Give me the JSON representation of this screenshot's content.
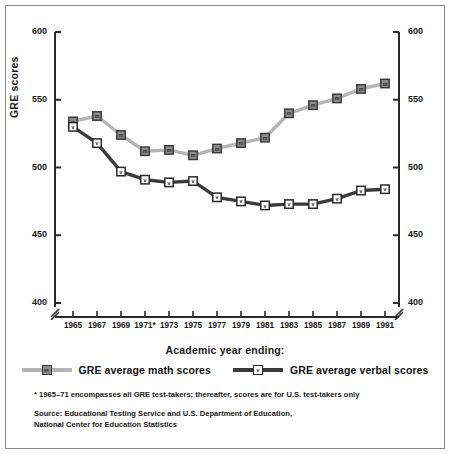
{
  "chart_data": {
    "type": "line",
    "title": "",
    "xlabel": "Academic year ending:",
    "ylabel": "GRE scores",
    "ylim": [
      400,
      600
    ],
    "yticks": [
      400,
      450,
      500,
      550,
      600
    ],
    "grid": false,
    "legend_position": "bottom",
    "axis_break_y": true,
    "x": [
      1965,
      1966,
      1967,
      1968,
      1969,
      1970,
      1971,
      1972,
      1973,
      1974,
      1975,
      1976,
      1977,
      1978,
      1979,
      1980,
      1981,
      1982,
      1983,
      1984,
      1985,
      1986,
      1987,
      1988,
      1989,
      1990,
      1991
    ],
    "xtick_labels": [
      "1965",
      "1967",
      "1969",
      "1971*",
      "1973",
      "1975",
      "1977",
      "1979",
      "1981",
      "1983",
      "1985",
      "1987",
      "1989",
      "1991"
    ],
    "xtick_values": [
      1965,
      1967,
      1969,
      1971,
      1973,
      1975,
      1977,
      1979,
      1981,
      1983,
      1985,
      1987,
      1989,
      1991
    ],
    "series": [
      {
        "name": "GRE average math scores",
        "marker_letter": "m",
        "color": "#b4b4b4",
        "marker_fill": "#8e8e8e",
        "marker_stroke": "#3b3b3b",
        "x": [
          1965,
          1967,
          1969,
          1971,
          1973,
          1975,
          1977,
          1979,
          1981,
          1983,
          1985,
          1987,
          1989,
          1991
        ],
        "values": [
          534,
          538,
          524,
          512,
          513,
          509,
          514,
          518,
          522,
          540,
          546,
          551,
          558,
          562
        ]
      },
      {
        "name": "GRE average verbal scores",
        "marker_letter": "v",
        "color": "#3b3b3b",
        "marker_fill": "#ffffff",
        "marker_stroke": "#2a2a2a",
        "x": [
          1965,
          1967,
          1969,
          1971,
          1973,
          1975,
          1977,
          1979,
          1981,
          1983,
          1985,
          1987,
          1989,
          1991
        ],
        "values": [
          530,
          518,
          497,
          491,
          489,
          490,
          478,
          475,
          472,
          473,
          473,
          477,
          483,
          484
        ]
      }
    ],
    "annotations": [
      "* 1965–71 encompasses all GRE test-takers; thereafter, scores are for U.S. test-takers only"
    ]
  },
  "axis": {
    "y_title": "GRE scores",
    "x_title": "Academic year ending:",
    "y_ticks": [
      "600",
      "550",
      "500",
      "450",
      "400"
    ]
  },
  "legend": {
    "entries": [
      {
        "label": "GRE average math scores",
        "letter": "m"
      },
      {
        "label": "GRE average verbal scores",
        "letter": "v"
      }
    ]
  },
  "notes": {
    "footnote": "* 1965–71 encompasses all GRE test-takers; thereafter, scores are for U.S. test-takers only",
    "source_line1": "Source: Educational Testing Service and U.S. Department of Education,",
    "source_line2": "National Center for Education Statistics"
  },
  "colors": {
    "math_line": "#b4b4b4",
    "verbal_line": "#3b3b3b",
    "axis": "#2a2a2a",
    "border": "#8a8a8a",
    "text": "#1a1a1a"
  }
}
